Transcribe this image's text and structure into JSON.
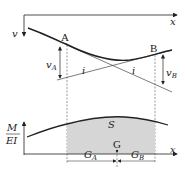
{
  "diagram": {
    "title": "",
    "top_plot": {
      "x_axis_label": "x",
      "y_axis_label": "v",
      "point_a_label": "A",
      "point_b_label": "B",
      "deflection_a_label": "v",
      "deflection_a_sub": "A",
      "deflection_b_label": "v",
      "deflection_b_sub": "B",
      "tangent_a_label": "i",
      "tangent_b_label": "i"
    },
    "bottom_plot": {
      "y_axis_label_num": "M",
      "y_axis_label_den": "EI",
      "x_axis_label": "x",
      "area_label": "S",
      "centroid_label": "G",
      "dim_a_label": "G",
      "dim_a_sub": "A",
      "dim_b_label": "G",
      "dim_b_sub": "B"
    },
    "colors": {
      "line": "#222222",
      "shade": "#d6d6d6"
    }
  }
}
